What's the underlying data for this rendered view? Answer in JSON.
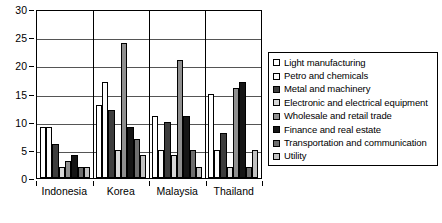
{
  "chart_data": {
    "type": "bar",
    "title": "",
    "subtitle": "",
    "xlabel": "",
    "ylabel": "",
    "ylim": [
      0,
      30
    ],
    "yticks": [
      0,
      5,
      10,
      15,
      20,
      25,
      30
    ],
    "grid": true,
    "legend_position": "right",
    "categories": [
      "Indonesia",
      "Korea",
      "Malaysia",
      "Thailand"
    ],
    "series": [
      {
        "name": "Light manufacturing",
        "color": "#ffffff",
        "values": [
          9,
          13,
          11,
          15
        ]
      },
      {
        "name": "Petro and chemicals",
        "color": "#fbfbfb",
        "values": [
          9,
          17,
          5,
          5
        ]
      },
      {
        "name": "Metal and machinery",
        "color": "#3d3d3d",
        "values": [
          6,
          12,
          10,
          8
        ]
      },
      {
        "name": "Electronic and electrical equipment",
        "color": "#d7d7d7",
        "values": [
          2,
          5,
          4,
          2
        ]
      },
      {
        "name": "Wholesale and retail trade",
        "color": "#8f8f8f",
        "values": [
          3,
          24,
          21,
          16
        ]
      },
      {
        "name": "Finance and real estate",
        "color": "#151515",
        "values": [
          4,
          9,
          11,
          17
        ]
      },
      {
        "name": "Transportation and communication",
        "color": "#6e6e6e",
        "values": [
          2,
          7,
          5,
          2
        ]
      },
      {
        "name": "Utility",
        "color": "#c2c2c2",
        "values": [
          2,
          4,
          2,
          5
        ]
      }
    ]
  },
  "axis": {
    "y_tick_labels": [
      "30",
      "25",
      "20",
      "15",
      "10",
      "5",
      "0"
    ]
  },
  "legend": {
    "items": [
      "Light manufacturing",
      "Petro and chemicals",
      "Metal and machinery",
      "Electronic and electrical equipment",
      "Wholesale and retail trade",
      "Finance and real estate",
      "Transportation and communication",
      "Utility"
    ]
  }
}
